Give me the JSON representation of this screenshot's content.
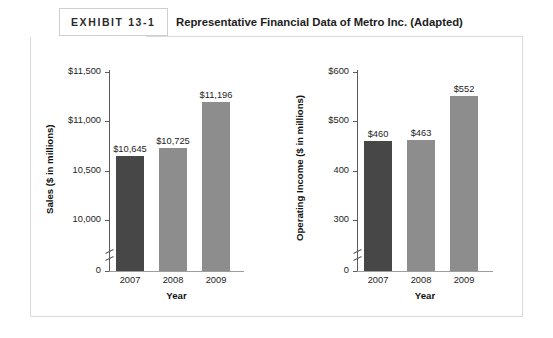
{
  "exhibit": {
    "tag": "EXHIBIT 13-1",
    "title": "Representative Financial Data of Metro Inc. (Adapted)"
  },
  "colors": {
    "bar_dark": "#474747",
    "bar_light": "#8d8d8d",
    "frame_border": "#dadada",
    "axis": "#5b5b5b",
    "text": "#1d1d1d"
  },
  "chart_data": [
    {
      "type": "bar",
      "id": "sales",
      "title": "",
      "xlabel": "Year",
      "ylabel": "Sales  ($ in millions)",
      "categories": [
        "2007",
        "2008",
        "2009"
      ],
      "values": [
        10645,
        10725,
        11196
      ],
      "value_labels": [
        "$10,645",
        "$10,725",
        "$11,196"
      ],
      "bar_colors": [
        "#474747",
        "#8d8d8d",
        "#8d8d8d"
      ],
      "ytick_labels": [
        "$11,500",
        "$11,000",
        "10,500",
        "10,000",
        "0"
      ],
      "ytick_values": [
        11500,
        11000,
        10500,
        10000,
        0
      ],
      "ylim": [
        9750,
        11500
      ],
      "axis_break": true,
      "grid": false,
      "legend": false
    },
    {
      "type": "bar",
      "id": "operating-income",
      "title": "",
      "xlabel": "Year",
      "ylabel": "Operating Income ($ in millions)",
      "categories": [
        "2007",
        "2008",
        "2009"
      ],
      "values": [
        460,
        463,
        552
      ],
      "value_labels": [
        "$460",
        "$463",
        "$552"
      ],
      "bar_colors": [
        "#474747",
        "#8d8d8d",
        "#8d8d8d"
      ],
      "ytick_labels": [
        "$600",
        "$500",
        "400",
        "300",
        "0"
      ],
      "ytick_values": [
        600,
        500,
        400,
        300,
        0
      ],
      "ylim": [
        250,
        600
      ],
      "axis_break": true,
      "grid": false,
      "legend": false
    }
  ]
}
